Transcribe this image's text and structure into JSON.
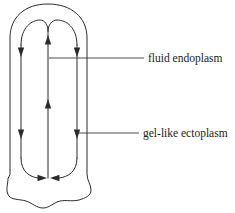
{
  "figure": {
    "background_color": "#ffffff",
    "stroke_color": "#2b2b2b"
  },
  "labels": [
    {
      "id": "fluid-endoplasm",
      "text": "fluid endoplasm",
      "text_x": 148,
      "text_y": 59,
      "leader": {
        "x1": 49,
        "y1": 58,
        "x2": 144,
        "y2": 58
      }
    },
    {
      "id": "gel-like-ectoplasm",
      "text": "gel-like ectoplasm",
      "text_x": 143,
      "text_y": 134,
      "leader": {
        "x1": 78,
        "y1": 133,
        "x2": 139,
        "y2": 133
      }
    }
  ],
  "cell_outline": {
    "name": "cell-membrane",
    "path": "M 10 174 L 10 38 C 10 17 25 4 48 4 C 71 4 87 17 87 38 L 87 174 C 87 181 91 184 91 190 C 91 196 85 198 79 200 C 71 202 64 199 57 202 C 51 205 48 208 43 208 C 37 208 32 203 26 201 C 19 199 12 200 9 196 C 5 191 8 184 8 179 Z"
  },
  "flow_loop": {
    "name": "endoplasm-flow-loop",
    "left_segment": "M 21 158 L 21 45",
    "right_segment": "M 77 158 L 77 45",
    "top_left_arc": "M 21 45 C 21 27 32 20 40 20 C 45 20 48 25 48 31",
    "top_right_arc": "M 77 45 C 77 27 66 20 57 20 C 52 20 48 25 48 31",
    "bottom_left_arc": "M 21 158 C 21 172 30 177 38 178",
    "bottom_right_arc": "M 77 158 C 77 172 68 177 59 178",
    "center_segment": "M 48 31 L 48 178"
  },
  "flow_arrows": [
    {
      "id": "left-down-upper",
      "direction": "down",
      "x": 21,
      "y": 50
    },
    {
      "id": "center-up-upper",
      "direction": "up",
      "x": 48,
      "y": 42
    },
    {
      "id": "right-down-upper",
      "direction": "down",
      "x": 77,
      "y": 50
    },
    {
      "id": "center-up-middle",
      "direction": "up",
      "x": 48,
      "y": 106
    },
    {
      "id": "left-down-lower",
      "direction": "down",
      "x": 21,
      "y": 132
    },
    {
      "id": "right-down-lower",
      "direction": "down",
      "x": 77,
      "y": 132
    },
    {
      "id": "bottom-left-inward",
      "direction": "right",
      "x": 40,
      "y": 178
    },
    {
      "id": "bottom-right-inward",
      "direction": "left",
      "x": 57,
      "y": 178
    }
  ]
}
